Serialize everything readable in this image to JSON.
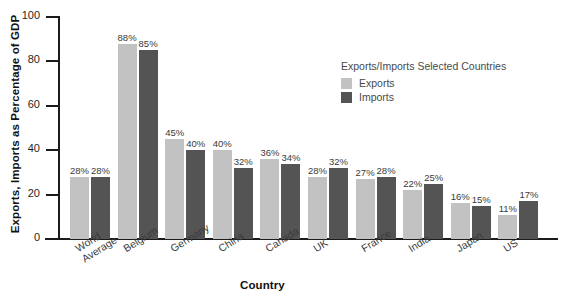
{
  "chart_data": {
    "type": "bar",
    "title": "",
    "xlabel": "Country",
    "ylabel": "Exports, Imports as Percentage of GDP",
    "ylim": [
      0,
      100
    ],
    "yticks": [
      0,
      20,
      40,
      60,
      80,
      100
    ],
    "grid": false,
    "legend_position": "inside-top-right",
    "legend_title": "Exports/Imports Selected Countries",
    "categories": [
      "World Average",
      "Belgium",
      "Germany",
      "China",
      "Canada",
      "UK",
      "France",
      "India",
      "Japan",
      "US"
    ],
    "category_lines": [
      [
        "World",
        "Average"
      ],
      [
        "Belgium"
      ],
      [
        "Germany"
      ],
      [
        "China"
      ],
      [
        "Canada"
      ],
      [
        "UK"
      ],
      [
        "France"
      ],
      [
        "India"
      ],
      [
        "Japan"
      ],
      [
        "US"
      ]
    ],
    "series": [
      {
        "name": "Exports",
        "color": "#c2c2c2",
        "values": [
          28,
          88,
          45,
          40,
          36,
          28,
          27,
          22,
          16,
          11
        ],
        "labels": [
          "28%",
          "88%",
          "45%",
          "40%",
          "36%",
          "28%",
          "27%",
          "22%",
          "16%",
          "11%"
        ]
      },
      {
        "name": "Imports",
        "color": "#545454",
        "values": [
          28,
          85,
          40,
          32,
          34,
          32,
          28,
          25,
          15,
          17
        ],
        "labels": [
          "28%",
          "85%",
          "40%",
          "32%",
          "34%",
          "32%",
          "28%",
          "25%",
          "15%",
          "17%"
        ]
      }
    ]
  },
  "axis": {
    "y_title": "Exports, Imports as Percentage of GDP",
    "x_title": "Country",
    "y_tick_labels": [
      "0",
      "20",
      "40",
      "60",
      "80",
      "100"
    ]
  },
  "legend": {
    "title": "Exports/Imports Selected Countries",
    "items": [
      {
        "label": "Exports",
        "color": "#c2c2c2"
      },
      {
        "label": "Imports",
        "color": "#545454"
      }
    ]
  }
}
